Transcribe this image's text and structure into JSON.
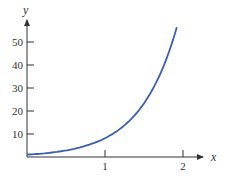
{
  "chart_data": {
    "type": "line",
    "title": "",
    "xlabel": "x",
    "ylabel": "y",
    "xlim": [
      0,
      2.2
    ],
    "ylim": [
      0,
      57
    ],
    "x_ticks": [
      1,
      2
    ],
    "x_tick_labels": [
      "1",
      "2"
    ],
    "y_ticks": [
      10,
      20,
      30,
      40,
      50
    ],
    "y_tick_labels": [
      "10",
      "20",
      "30",
      "40",
      "50"
    ],
    "grid": false,
    "legend": null,
    "series": [
      {
        "name": "exponential curve",
        "x": [
          0,
          0.2,
          0.4,
          0.6,
          0.8,
          1.0,
          1.2,
          1.4,
          1.6,
          1.8,
          1.92
        ],
        "values": [
          1.0,
          1.5,
          2.3,
          3.5,
          5.4,
          8.2,
          12.4,
          18.9,
          28.8,
          43.8,
          56.4
        ]
      }
    ],
    "colors": {
      "curve": "#3a5fb0",
      "axis": "#333333"
    }
  }
}
